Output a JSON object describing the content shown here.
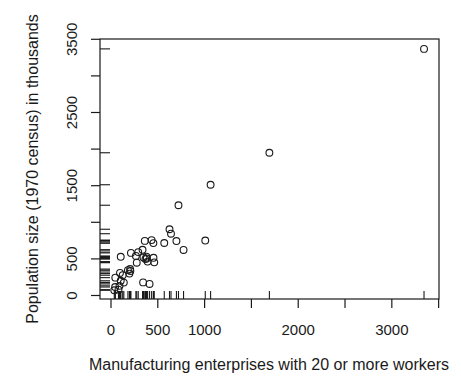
{
  "figure": {
    "background_color": "#ffffff",
    "axis_color": "#1a1a1a",
    "point_color": "#1a1a1a"
  },
  "chart_data": {
    "type": "scatter",
    "title": "",
    "xlabel": "Manufacturing enterprises with 20 or more workers",
    "ylabel": "Population size (1970 census) in thousands",
    "x_ticks": [
      0,
      500,
      1000,
      1500,
      2000,
      2500,
      3000,
      3500
    ],
    "x_tick_labels": [
      "0",
      "500",
      "1000",
      "",
      "2000",
      "",
      "3000",
      ""
    ],
    "y_ticks": [
      0,
      500,
      1000,
      1500,
      2000,
      2500,
      3000,
      3500
    ],
    "y_tick_labels": [
      "0",
      "500",
      "",
      "1500",
      "",
      "2500",
      "",
      "3500"
    ],
    "xlim": [
      -117.5,
      3504
    ],
    "ylim": [
      -47.8,
      3504
    ],
    "grid": false,
    "marker": "open-circle",
    "rug_sides": [
      "bottom",
      "left"
    ],
    "points": [
      [
        44,
        116
      ],
      [
        46,
        244
      ],
      [
        368,
        497
      ],
      [
        625,
        905
      ],
      [
        391,
        463
      ],
      [
        35,
        71
      ],
      [
        3344,
        3369
      ],
      [
        462,
        453
      ],
      [
        1007,
        751
      ],
      [
        266,
        540
      ],
      [
        641,
        844
      ],
      [
        454,
        515
      ],
      [
        104,
        201
      ],
      [
        1064,
        1513
      ],
      [
        412,
        158
      ],
      [
        721,
        1233
      ],
      [
        361,
        746
      ],
      [
        104,
        529
      ],
      [
        381,
        507
      ],
      [
        91,
        132
      ],
      [
        291,
        593
      ],
      [
        337,
        624
      ],
      [
        207,
        335
      ],
      [
        569,
        717
      ],
      [
        699,
        744
      ],
      [
        275,
        448
      ],
      [
        204,
        361
      ],
      [
        96,
        308
      ],
      [
        181,
        347
      ],
      [
        1692,
        1950
      ],
      [
        213,
        582
      ],
      [
        347,
        520
      ],
      [
        343,
        179
      ],
      [
        197,
        299
      ],
      [
        137,
        176
      ],
      [
        453,
        716
      ],
      [
        379,
        531
      ],
      [
        775,
        622
      ],
      [
        434,
        757
      ],
      [
        125,
        277
      ],
      [
        80,
        80
      ]
    ]
  }
}
